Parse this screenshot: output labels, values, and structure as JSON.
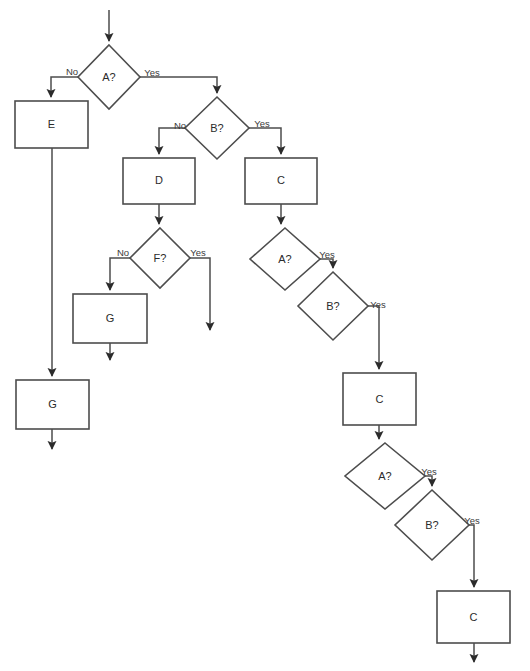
{
  "diagram": {
    "type": "flowchart",
    "background_color": "#ffffff",
    "stroke_color": "#4d4d4d",
    "text_color": "#2b2b2b",
    "nodes": [
      {
        "id": "d-a1",
        "shape": "diamond",
        "label": "A?",
        "cx": 109,
        "cy": 77,
        "rx": 31,
        "ry": 32
      },
      {
        "id": "p-e1",
        "shape": "rect",
        "label": "E",
        "x": 15,
        "y": 101,
        "w": 73,
        "h": 47
      },
      {
        "id": "d-b1",
        "shape": "diamond",
        "label": "B?",
        "cx": 217,
        "cy": 128,
        "rx": 32,
        "ry": 31
      },
      {
        "id": "p-d1",
        "shape": "rect",
        "label": "D",
        "x": 123,
        "y": 158,
        "w": 72,
        "h": 46
      },
      {
        "id": "p-c1",
        "shape": "rect",
        "label": "C",
        "x": 245,
        "y": 158,
        "w": 72,
        "h": 46
      },
      {
        "id": "d-f1",
        "shape": "diamond",
        "label": "F?",
        "cx": 160,
        "cy": 258,
        "rx": 30,
        "ry": 30
      },
      {
        "id": "p-g1",
        "shape": "rect",
        "label": "G",
        "x": 73,
        "y": 294,
        "w": 74,
        "h": 49
      },
      {
        "id": "p-g2",
        "shape": "rect",
        "label": "G",
        "x": 16,
        "y": 380,
        "w": 73,
        "h": 49
      },
      {
        "id": "d-a2",
        "shape": "diamond",
        "label": "A?",
        "cx": 285,
        "cy": 259,
        "rx": 35,
        "ry": 31
      },
      {
        "id": "d-b2",
        "shape": "diamond",
        "label": "B?",
        "cx": 333,
        "cy": 306,
        "rx": 35,
        "ry": 34
      },
      {
        "id": "p-c2",
        "shape": "rect",
        "label": "C",
        "x": 343,
        "y": 373,
        "w": 73,
        "h": 52
      },
      {
        "id": "d-a3",
        "shape": "diamond",
        "label": "A?",
        "cx": 385,
        "cy": 476,
        "rx": 40,
        "ry": 33
      },
      {
        "id": "d-b3",
        "shape": "diamond",
        "label": "B?",
        "cx": 432,
        "cy": 525,
        "rx": 37,
        "ry": 35
      },
      {
        "id": "p-c3",
        "shape": "rect",
        "label": "C",
        "x": 437,
        "y": 591,
        "w": 73,
        "h": 52
      }
    ],
    "edge_labels": [
      {
        "id": "lbl-a1-no",
        "text": "No",
        "x": 72,
        "y": 72
      },
      {
        "id": "lbl-a1-yes",
        "text": "Yes",
        "x": 152,
        "y": 73
      },
      {
        "id": "lbl-b1-no",
        "text": "No",
        "x": 180,
        "y": 126
      },
      {
        "id": "lbl-b1-yes",
        "text": "Yes",
        "x": 262,
        "y": 124
      },
      {
        "id": "lbl-f1-no",
        "text": "No",
        "x": 123,
        "y": 253
      },
      {
        "id": "lbl-f1-yes",
        "text": "Yes",
        "x": 198,
        "y": 253
      },
      {
        "id": "lbl-a2-yes",
        "text": "Yes",
        "x": 327,
        "y": 255
      },
      {
        "id": "lbl-b2-yes",
        "text": "Yes",
        "x": 378,
        "y": 305
      },
      {
        "id": "lbl-a3-yes",
        "text": "Yes",
        "x": 429,
        "y": 472
      },
      {
        "id": "lbl-b3-yes",
        "text": "Yes",
        "x": 472,
        "y": 521
      }
    ],
    "edges": [
      {
        "id": "e-start-a1",
        "from": "start",
        "to": "d-a1",
        "label": ""
      },
      {
        "id": "e-a1-e1",
        "from": "d-a1",
        "to": "p-e1",
        "label": "No"
      },
      {
        "id": "e-a1-b1",
        "from": "d-a1",
        "to": "d-b1",
        "label": "Yes"
      },
      {
        "id": "e-b1-d1",
        "from": "d-b1",
        "to": "p-d1",
        "label": "No"
      },
      {
        "id": "e-b1-c1",
        "from": "d-b1",
        "to": "p-c1",
        "label": "Yes"
      },
      {
        "id": "e-d1-f1",
        "from": "p-d1",
        "to": "d-f1",
        "label": ""
      },
      {
        "id": "e-f1-g1",
        "from": "d-f1",
        "to": "p-g1",
        "label": "No"
      },
      {
        "id": "e-f1-end",
        "from": "d-f1",
        "to": "end",
        "label": "Yes"
      },
      {
        "id": "e-g1-end",
        "from": "p-g1",
        "to": "end",
        "label": ""
      },
      {
        "id": "e-e1-g2",
        "from": "p-e1",
        "to": "p-g2",
        "label": ""
      },
      {
        "id": "e-g2-end",
        "from": "p-g2",
        "to": "end",
        "label": ""
      },
      {
        "id": "e-c1-a2",
        "from": "p-c1",
        "to": "d-a2",
        "label": ""
      },
      {
        "id": "e-a2-b2",
        "from": "d-a2",
        "to": "d-b2",
        "label": "Yes"
      },
      {
        "id": "e-b2-c2",
        "from": "d-b2",
        "to": "p-c2",
        "label": "Yes"
      },
      {
        "id": "e-c2-a3",
        "from": "p-c2",
        "to": "d-a3",
        "label": ""
      },
      {
        "id": "e-a3-b3",
        "from": "d-a3",
        "to": "d-b3",
        "label": "Yes"
      },
      {
        "id": "e-b3-c3",
        "from": "d-b3",
        "to": "p-c3",
        "label": "Yes"
      },
      {
        "id": "e-c3-end",
        "from": "p-c3",
        "to": "end",
        "label": ""
      }
    ]
  }
}
